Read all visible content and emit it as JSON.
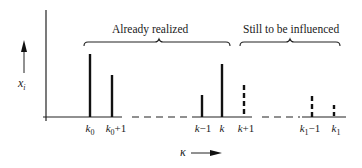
{
  "diagram": {
    "y_axis_label": "x",
    "y_axis_label_sub": "i",
    "x_axis_label": "κ",
    "groups": [
      {
        "label": "Already realized"
      },
      {
        "label": "Still to be influenced"
      }
    ],
    "ticks": [
      {
        "base": "k",
        "sub": "0",
        "suffix": ""
      },
      {
        "base": "k",
        "sub": "0",
        "suffix": "+1"
      },
      {
        "base": "k",
        "sub": "",
        "suffix": "−1"
      },
      {
        "base": "k",
        "sub": "",
        "suffix": ""
      },
      {
        "base": "k",
        "sub": "",
        "suffix": "+1"
      },
      {
        "base": "k",
        "sub": "1",
        "suffix": "−1"
      },
      {
        "base": "k",
        "sub": "1",
        "suffix": ""
      }
    ],
    "bars": [
      {
        "tick": "k0",
        "height": 63,
        "style": "solid"
      },
      {
        "tick": "k0+1",
        "height": 42,
        "style": "solid"
      },
      {
        "tick": "k-1",
        "height": 22,
        "style": "solid"
      },
      {
        "tick": "k",
        "height": 53,
        "style": "solid"
      },
      {
        "tick": "k+1",
        "height": 32,
        "style": "dashed"
      },
      {
        "tick": "k1-1",
        "height": 21,
        "style": "dashed"
      },
      {
        "tick": "k1",
        "height": 12,
        "style": "dashed"
      }
    ]
  }
}
